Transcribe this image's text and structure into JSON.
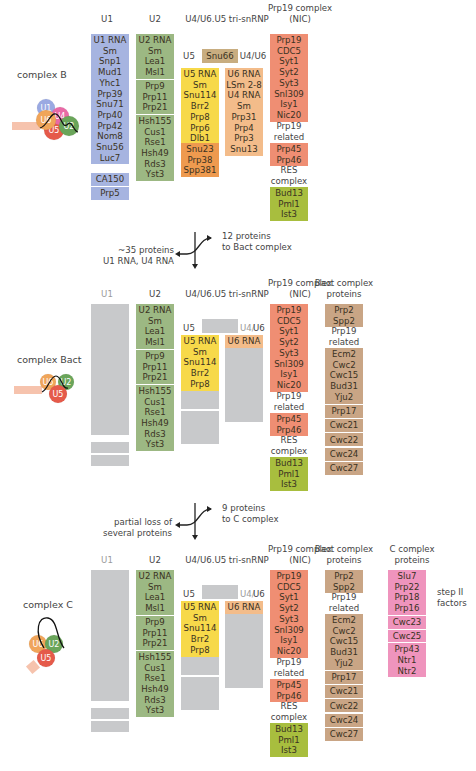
{
  "colors": {
    "u1": "#a6b4e0",
    "u2": "#9cb883",
    "u5": "#f7d94a",
    "u5_orange": "#ee9a4f",
    "u4u6": "#f3bc8a",
    "snu66": "#c8ad80",
    "nic": "#ef8e73",
    "res": "#a8be3e",
    "bact": "#c9a585",
    "c_complex": "#ef94bd",
    "lost": "#c8c9cb"
  },
  "headers": {
    "u1": "U1",
    "u2": "U2",
    "tri": "U4/U6.U5 tri-snRNP",
    "nic_line1": "Prp19 complex",
    "nic_line2": "(NIC)",
    "bact_line1": "Bact complex",
    "bact_line2": "proteins",
    "c_line1": "C complex",
    "c_line2": "proteins",
    "u5": "U5",
    "u4": "U4/",
    "u6": "U6",
    "u4u6": "U4/U6"
  },
  "complex_b": {
    "label": "complex B",
    "icon_labels": [
      "U1",
      "U6",
      "U4",
      "U5",
      "U2"
    ],
    "u1": [
      [
        "U1 RNA",
        "Sm",
        "Snp1",
        "Mud1",
        "Yhc1",
        "Prp39",
        "Snu71",
        "Prp40",
        "Prp42",
        "Nom8",
        "Snu56",
        "Luc7"
      ],
      [
        "CA150"
      ],
      [
        "Prp5"
      ]
    ],
    "u2": [
      [
        "U2 RNA",
        "Sm",
        "Lea1",
        "Msl1"
      ],
      [
        "Prp9",
        "Prp11",
        "Prp21"
      ],
      [
        "Hsh155",
        "Cus1",
        "Rse1",
        "Hsh49",
        "Rds3",
        "Yst3"
      ]
    ],
    "snu66": "Snu66",
    "u5_yellow": [
      "U5 RNA",
      "Sm",
      "Snu114",
      "Brr2",
      "Prp8",
      "Prp6",
      "Dlb1"
    ],
    "u5_orange": [
      "Snu23",
      "Prp38",
      "Spp381"
    ],
    "u4u6": [
      "U6 RNA",
      "LSm 2-8",
      "U4 RNA",
      "Sm",
      "Prp31",
      "Prp4",
      "Prp3",
      "Snu13"
    ],
    "nic_core": [
      "Prp19",
      "CDC5",
      "Syt1",
      "Syt2",
      "Syt3",
      "Snl309",
      "Isy1",
      "Nic20"
    ],
    "nic_related_label": [
      "Prp19",
      "related"
    ],
    "nic_related": [
      "Prp45",
      "Prp46"
    ],
    "res_label": [
      "RES",
      "complex"
    ],
    "res": [
      "Bud13",
      "Pml1",
      "Ist3"
    ]
  },
  "transition_1": {
    "lost": [
      "~35 proteins",
      "U1 RNA, U4 RNA"
    ],
    "gained": [
      "12 proteins",
      "to Bact complex"
    ]
  },
  "complex_bact": {
    "label": "complex Bact",
    "icon_labels": [
      "U6",
      "U2",
      "U5"
    ],
    "u2": [
      [
        "U2 RNA",
        "Sm",
        "Lea1",
        "Msl1"
      ],
      [
        "Prp9",
        "Prp11",
        "Prp21"
      ],
      [
        "Hsh155",
        "Cus1",
        "Rse1",
        "Hsh49",
        "Rds3",
        "Yst3"
      ]
    ],
    "u5_yellow": [
      "U5 RNA",
      "Sm",
      "Snu114",
      "Brr2",
      "Prp8"
    ],
    "u6": [
      "U6 RNA"
    ],
    "nic_core": [
      "Prp19",
      "CDC5",
      "Syt1",
      "Syt2",
      "Syt3",
      "Snl309",
      "Isy1",
      "Nic20"
    ],
    "nic_related_label": [
      "Prp19",
      "related"
    ],
    "nic_related": [
      "Prp45",
      "Prp46"
    ],
    "res_label": [
      "RES",
      "complex"
    ],
    "res": [
      "Bud13",
      "Pml1",
      "Ist3"
    ],
    "bact_top": [
      "Prp2",
      "Spp2"
    ],
    "bact_related_label": [
      "Prp19",
      "related"
    ],
    "bact_related": [
      "Ecm2",
      "Cwc2",
      "Cwc15",
      "Bud31",
      "Yju2"
    ],
    "bact_singles": [
      "Prp17",
      "Cwc21",
      "Cwc22",
      "Cwc24",
      "Cwc27"
    ]
  },
  "transition_2": {
    "lost": [
      "partial loss of",
      "several proteins"
    ],
    "gained": [
      "9 proteins",
      "to C complex"
    ]
  },
  "complex_c": {
    "label": "complex C",
    "icon_labels": [
      "U6",
      "U2",
      "U5"
    ],
    "u2": [
      [
        "U2 RNA",
        "Sm",
        "Lea1",
        "Msl1"
      ],
      [
        "Prp9",
        "Prp11",
        "Prp21"
      ],
      [
        "Hsh155",
        "Cus1",
        "Rse1",
        "Hsh49",
        "Rds3",
        "Yst3"
      ]
    ],
    "u5_yellow": [
      "U5 RNA",
      "Sm",
      "Snu114",
      "Brr2",
      "Prp8"
    ],
    "u6": [
      "U6 RNA"
    ],
    "nic_core": [
      "Prp19",
      "CDC5",
      "Syt1",
      "Syt2",
      "Syt3",
      "Snl309",
      "Isy1",
      "Nic20"
    ],
    "nic_related_label": [
      "Prp19",
      "related"
    ],
    "nic_related": [
      "Prp45",
      "Prp46"
    ],
    "res_label": [
      "RES",
      "complex"
    ],
    "res": [
      "Bud13",
      "Pml1",
      "Ist3"
    ],
    "bact_top": [
      "Prp2",
      "Spp2"
    ],
    "bact_related_label": [
      "Prp19",
      "related"
    ],
    "bact_related": [
      "Ecm2",
      "Cwc2",
      "Cwc15",
      "Bud31",
      "Yju2"
    ],
    "bact_singles": [
      "Prp17",
      "Cwc21",
      "Cwc22",
      "Cwc24",
      "Cwc27"
    ],
    "c_proteins": [
      [
        "Slu7",
        "Prp22",
        "Prp18",
        "Prp16"
      ],
      [
        "Cwc23"
      ],
      [
        "Cwc25"
      ],
      [
        "Prp43",
        "Ntr1",
        "Ntr2"
      ]
    ],
    "step2_label": [
      "step II",
      "factors"
    ]
  }
}
